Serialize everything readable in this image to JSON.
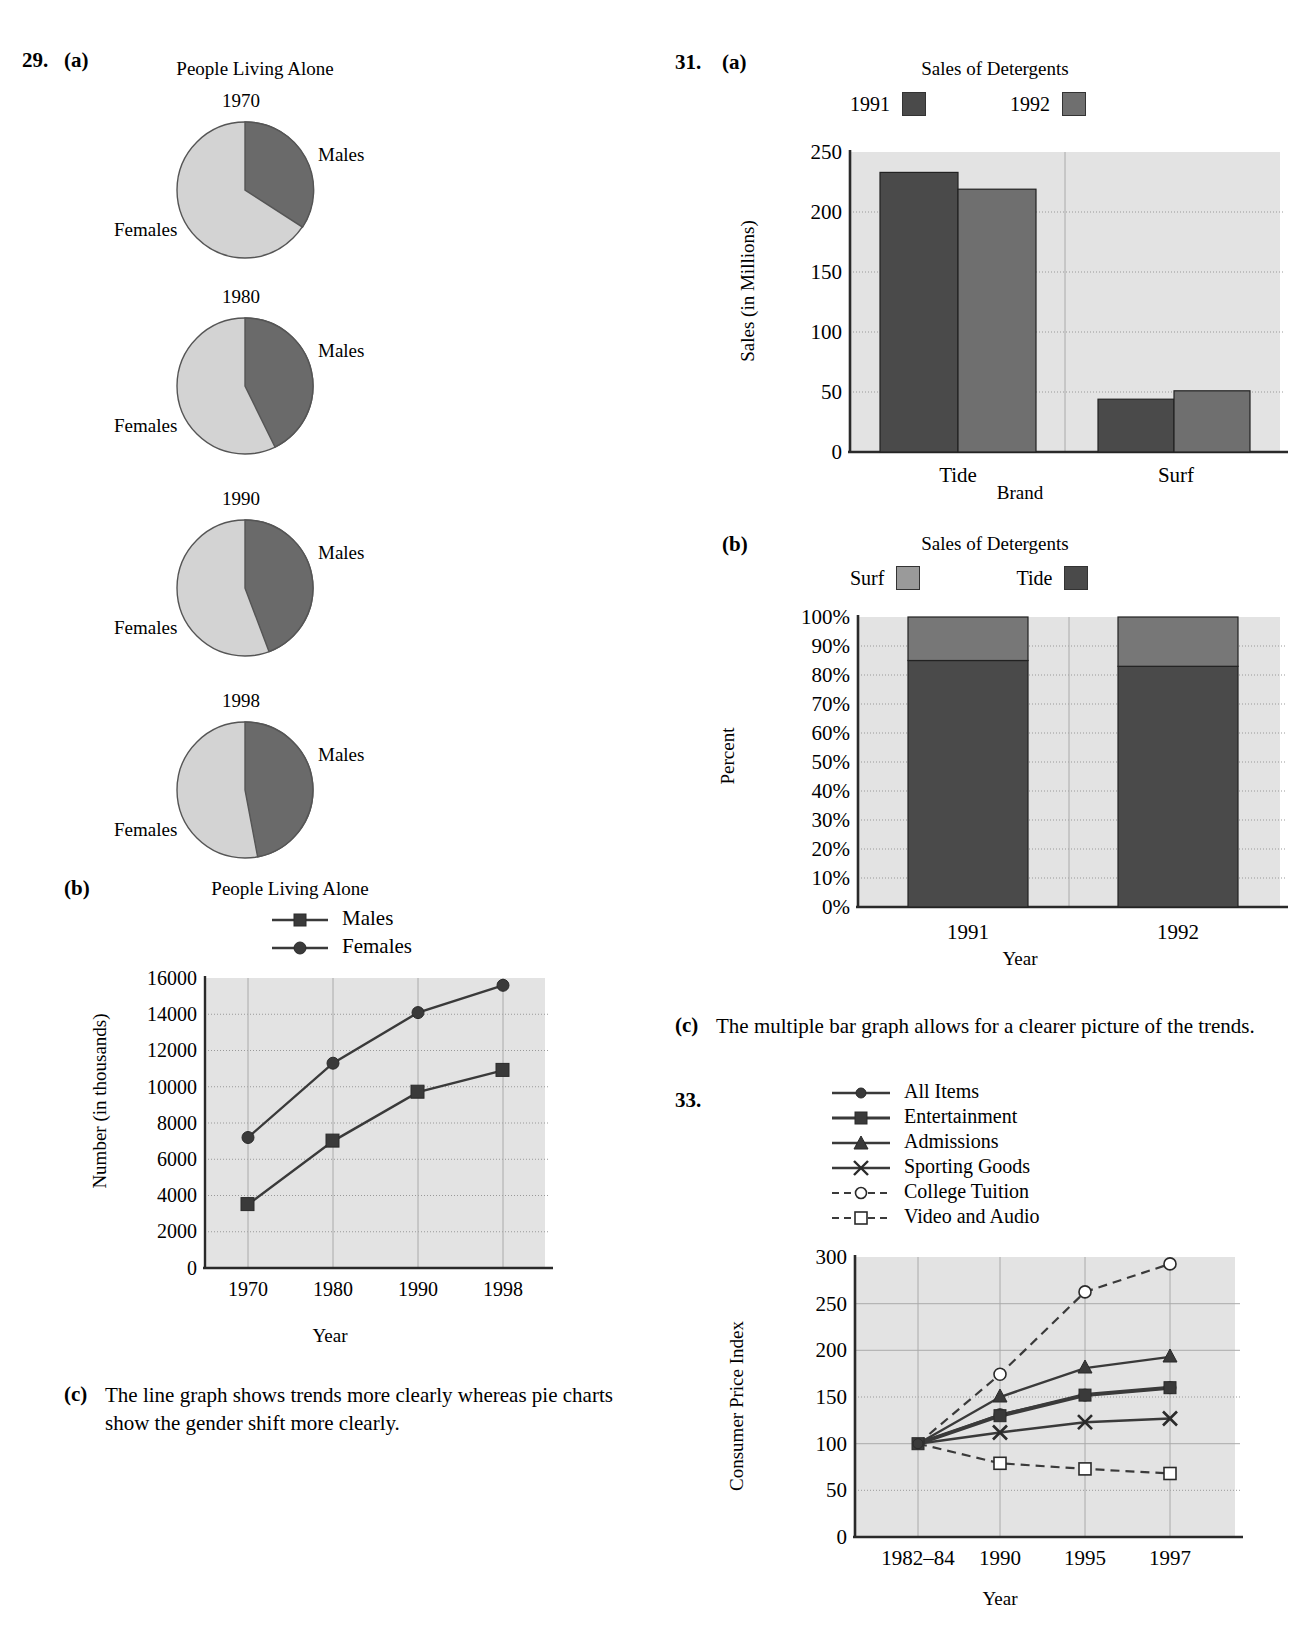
{
  "problem29": {
    "number": "29.",
    "part_a": "(a)",
    "part_b": "(b)",
    "part_c": "(c)",
    "part_c_text": "The line graph shows trends more clearly whereas pie charts show the gender shift more clearly.",
    "pies": {
      "title": "People Living Alone",
      "males_label": "Males",
      "females_label": "Females",
      "items": [
        {
          "year": "1970",
          "males_pct": 33,
          "females_pct": 67
        },
        {
          "year": "1980",
          "males_pct": 39,
          "females_pct": 61
        },
        {
          "year": "1990",
          "males_pct": 40,
          "females_pct": 60
        },
        {
          "year": "1998",
          "males_pct": 42,
          "females_pct": 58
        }
      ]
    },
    "line_chart": {
      "type": "line",
      "title": "People Living Alone",
      "xlabel": "Year",
      "ylabel": "Number (in thousands)",
      "categories": [
        "1970",
        "1980",
        "1990",
        "1998"
      ],
      "ylim": [
        0,
        16000
      ],
      "yticks": [
        "0",
        "2000",
        "4000",
        "6000",
        "8000",
        "10000",
        "12000",
        "14000",
        "16000"
      ],
      "grid": true,
      "legend_position": "top",
      "series": [
        {
          "name": "Males",
          "marker": "square",
          "values": [
            3500,
            7000,
            9700,
            10900
          ]
        },
        {
          "name": "Females",
          "marker": "circle",
          "values": [
            7200,
            11300,
            14100,
            15600
          ]
        }
      ]
    }
  },
  "problem31": {
    "number": "31.",
    "part_a": "(a)",
    "part_b": "(b)",
    "part_c": "(c)",
    "part_c_text": "The multiple bar graph allows for a clearer picture of the trends.",
    "bar_chart": {
      "type": "bar",
      "title": "Sales of Detergents",
      "xlabel": "Brand",
      "ylabel": "Sales (in Millions)",
      "categories": [
        "Tide",
        "Surf"
      ],
      "ylim": [
        0,
        250
      ],
      "yticks": [
        "0",
        "50",
        "100",
        "150",
        "200",
        "250"
      ],
      "grid": true,
      "legend_position": "top",
      "series": [
        {
          "name": "1991",
          "color": "#4a4a4a",
          "values": [
            233,
            44
          ]
        },
        {
          "name": "1992",
          "color": "#6f6f6f",
          "values": [
            219,
            51
          ]
        }
      ]
    },
    "stacked_chart": {
      "type": "bar",
      "title": "Sales of Detergents",
      "xlabel": "Year",
      "ylabel": "Percent",
      "categories": [
        "1991",
        "1992"
      ],
      "ylim": [
        0,
        100
      ],
      "yticks": [
        "0%",
        "10%",
        "20%",
        "30%",
        "40%",
        "50%",
        "60%",
        "70%",
        "80%",
        "90%",
        "100%"
      ],
      "grid": true,
      "stacked": true,
      "legend_position": "top",
      "series": [
        {
          "name": "Surf",
          "color": "#777777",
          "values": [
            15,
            17
          ]
        },
        {
          "name": "Tide",
          "color": "#4a4a4a",
          "values": [
            85,
            83
          ]
        }
      ]
    }
  },
  "problem33": {
    "number": "33.",
    "chart": {
      "type": "line",
      "title": "",
      "xlabel": "Year",
      "ylabel": "Consumer Price Index",
      "categories": [
        "1982–84",
        "1990",
        "1995",
        "1997"
      ],
      "ylim": [
        0,
        300
      ],
      "yticks": [
        "0",
        "50",
        "100",
        "150",
        "200",
        "250",
        "300"
      ],
      "grid": true,
      "legend_position": "top",
      "series": [
        {
          "name": "All Items",
          "marker": "circle",
          "style": "solid",
          "values": [
            100,
            131,
            152,
            160
          ]
        },
        {
          "name": "Entertainment",
          "marker": "square",
          "style": "solid-thick",
          "values": [
            100,
            130,
            152,
            160
          ]
        },
        {
          "name": "Admissions",
          "marker": "triangle",
          "style": "solid",
          "values": [
            100,
            150,
            181,
            193
          ]
        },
        {
          "name": "Sporting Goods",
          "marker": "cross",
          "style": "solid",
          "values": [
            100,
            112,
            123,
            127
          ]
        },
        {
          "name": "College Tuition",
          "marker": "open-circle",
          "style": "dashed",
          "values": [
            100,
            175,
            263,
            293
          ]
        },
        {
          "name": "Video and Audio",
          "marker": "open-square",
          "style": "dashed",
          "values": [
            100,
            79,
            73,
            68
          ]
        }
      ]
    }
  }
}
